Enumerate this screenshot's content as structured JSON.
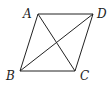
{
  "diagram": {
    "type": "parallelogram",
    "points": {
      "A": {
        "x": 38,
        "y": 14
      },
      "D": {
        "x": 93,
        "y": 14
      },
      "B": {
        "x": 20,
        "y": 71
      },
      "C": {
        "x": 75,
        "y": 71
      }
    },
    "labels": {
      "A": "A",
      "B": "B",
      "C": "C",
      "D": "D"
    },
    "edges": [
      "AD",
      "DC",
      "CB",
      "BA"
    ],
    "diagonals": [
      "AC",
      "BD"
    ],
    "stroke_color": "#222222"
  }
}
